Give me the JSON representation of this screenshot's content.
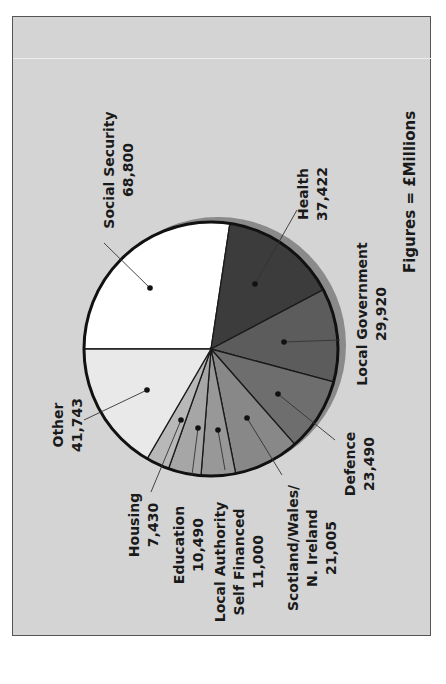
{
  "chart_data": {
    "type": "pie",
    "title": "",
    "note": "Figures = £Millions",
    "orientation": "rotated-90-clockwise",
    "total": 251300,
    "slices": [
      {
        "label": "Social Security",
        "value": 68800,
        "display": "68,800",
        "color": "#ffffff"
      },
      {
        "label": "Health",
        "value": 37422,
        "display": "37,422",
        "color": "#3c3c3c"
      },
      {
        "label": "Local Government",
        "value": 29920,
        "display": "29,920",
        "color": "#5c5c5c"
      },
      {
        "label": "Defence",
        "value": 23490,
        "display": "23,490",
        "color": "#6e6e6e"
      },
      {
        "label": "Scotland/Wales/ N. Ireland",
        "value": 21005,
        "display": "21,005",
        "color": "#888888"
      },
      {
        "label": "Local Authority Self Financed",
        "value": 11000,
        "display": "11,000",
        "color": "#989898"
      },
      {
        "label": "Education",
        "value": 10490,
        "display": "10,490",
        "color": "#a6a6a6"
      },
      {
        "label": "Housing",
        "value": 7430,
        "display": "7,430",
        "color": "#b8b8b8"
      },
      {
        "label": "Other",
        "value": 41743,
        "display": "41,743",
        "color": "#e9e9e9"
      }
    ]
  },
  "labels": {
    "note": "Figures = £Millions",
    "social_security": {
      "name": "Social Security",
      "value": "68,800"
    },
    "health": {
      "name": "Health",
      "value": "37,422"
    },
    "local_government": {
      "name": "Local Government",
      "value": "29,920"
    },
    "defence": {
      "name": "Defence",
      "value": "23,490"
    },
    "scotland": {
      "line1": "Scotland/Wales/",
      "line2": "N. Ireland",
      "value": "21,005"
    },
    "local_authority": {
      "line1": "Local Authority",
      "line2": "Self Financed",
      "value": "11,000"
    },
    "education": {
      "name": "Education",
      "value": "10,490"
    },
    "housing": {
      "name": "Housing",
      "value": "7,430"
    },
    "other": {
      "name": "Other",
      "value": "41,743"
    }
  },
  "colors": {
    "background": "#d4d4d4",
    "frame_border": "#555555",
    "pie_shadow": "#8a8a8a",
    "pie_outline": "#111111"
  }
}
